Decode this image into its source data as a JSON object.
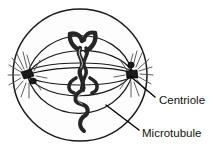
{
  "diagram": {
    "background_color": "#ffffff",
    "ink_color": "#1a1a1a",
    "cell_fill": "#fdfdfd",
    "chromosome_color": "#262626",
    "centriole_color": "#1a1a1a",
    "cell": {
      "name": "cell-membrane",
      "center_x": 80,
      "center_y": 75,
      "radius_x": 67,
      "radius_y": 66
    },
    "poles": [
      {
        "name": "left-pole",
        "x": 27,
        "y": 75
      },
      {
        "name": "right-pole",
        "x": 133,
        "y": 73
      }
    ],
    "labels": [
      {
        "id": "centriole",
        "text": "Centriole",
        "text_x": 159,
        "text_y": 104,
        "leader": {
          "x1": 155,
          "y1": 97,
          "x2": 130,
          "y2": 76
        }
      },
      {
        "id": "microtubule",
        "text": "Microtubule",
        "text_x": 142,
        "text_y": 137,
        "leader": {
          "x1": 139,
          "y1": 130,
          "x2": 106,
          "y2": 105
        }
      }
    ],
    "structures": {
      "spindle_fiber_count": 5,
      "aster_ray_count": 13,
      "equator_ellipse": true,
      "chromosome_count": 6
    }
  }
}
